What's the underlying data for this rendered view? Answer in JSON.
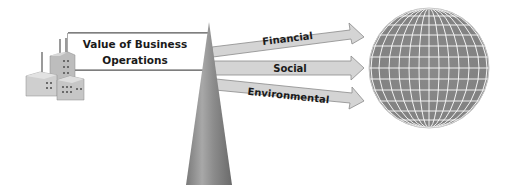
{
  "diagram": {
    "source_box": {
      "line1": "Value of Business",
      "line2": "Operations"
    },
    "arrows": [
      {
        "label": "Financial"
      },
      {
        "label": "Social"
      },
      {
        "label": "Environmental"
      }
    ],
    "icons": {
      "source": "factory-icon",
      "pivot": "triangle-cone",
      "target": "globe-icon"
    },
    "colors": {
      "arrow_fill": "#d4d4d4",
      "arrow_stroke": "#8a8a8a",
      "globe_fill": "#858585",
      "globe_grid": "#ffffff",
      "cone_dark": "#6e6e6e",
      "cone_light": "#b0b0b0"
    }
  }
}
